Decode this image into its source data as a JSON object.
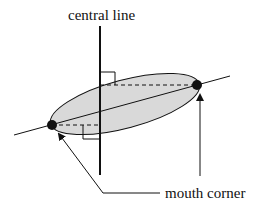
{
  "diagram": {
    "labels": {
      "central_line": "central line",
      "mouth_corner": "mouth corner"
    },
    "colors": {
      "ellipse_fill": "#d9d9d9",
      "stroke": "#111111",
      "background": "#ffffff"
    },
    "elements": {
      "central_line": "vertical line",
      "ellipse": "mouth region (shaded ellipse)",
      "mouth_corners": [
        "left mouth corner",
        "right mouth corner"
      ],
      "right_angle_marks": 2,
      "dashed_projections": 2,
      "arrows": 2
    }
  }
}
